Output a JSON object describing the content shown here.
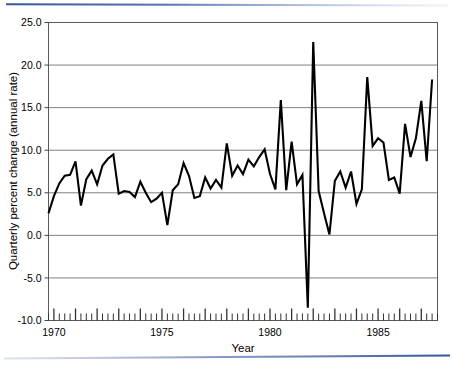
{
  "chart_data": {
    "type": "line",
    "title": "",
    "xlabel": "Year",
    "ylabel": "Quarterly percent change (annual rate)",
    "xlim": [
      1969.75,
      1987.75
    ],
    "ylim": [
      -10.0,
      25.0
    ],
    "grid": true,
    "legend": false,
    "legend_position": "none",
    "line_color": "#000000",
    "grid_color": "#808080",
    "frame_color": "#555555",
    "y_ticks": [
      "25.0",
      "20.0",
      "15.0",
      "10.0",
      "5.0",
      "0.0",
      "-5.0",
      "-10.0"
    ],
    "y_tick_values": [
      25.0,
      20.0,
      15.0,
      10.0,
      5.0,
      0.0,
      -5.0,
      -10.0
    ],
    "x_ticks": [
      "1970",
      "1975",
      "1980",
      "1985"
    ],
    "x_tick_values": [
      1970,
      1975,
      1980,
      1985
    ],
    "x_minor_tick_interval": 0.25,
    "series": [
      {
        "name": "Quarterly percent change (annual rate)",
        "x": [
          1969.75,
          1970.0,
          1970.25,
          1970.5,
          1970.75,
          1971.0,
          1971.25,
          1971.5,
          1971.75,
          1972.0,
          1972.25,
          1972.5,
          1972.75,
          1973.0,
          1973.25,
          1973.5,
          1973.75,
          1974.0,
          1974.25,
          1974.5,
          1974.75,
          1975.0,
          1975.25,
          1975.5,
          1975.75,
          1976.0,
          1976.25,
          1976.5,
          1976.75,
          1977.0,
          1977.25,
          1977.5,
          1977.75,
          1978.0,
          1978.25,
          1978.5,
          1978.75,
          1979.0,
          1979.25,
          1979.5,
          1979.75,
          1980.0,
          1980.25,
          1980.5,
          1980.75,
          1981.0,
          1981.25,
          1981.5,
          1981.75,
          1982.0,
          1982.25,
          1982.5,
          1982.75,
          1983.0,
          1983.25,
          1983.5,
          1983.75,
          1984.0,
          1984.25,
          1984.5,
          1984.75,
          1985.0,
          1985.25,
          1985.5,
          1985.75,
          1986.0,
          1986.25,
          1986.5,
          1986.75,
          1987.0,
          1987.25,
          1987.5
        ],
        "values": [
          2.6,
          4.6,
          6.1,
          7.0,
          7.1,
          8.7,
          3.5,
          6.6,
          7.6,
          6.0,
          8.2,
          9.0,
          9.5,
          4.9,
          5.2,
          5.1,
          4.5,
          6.3,
          5.0,
          3.9,
          4.3,
          5.0,
          1.2,
          5.3,
          6.0,
          8.5,
          7.0,
          4.4,
          4.6,
          6.8,
          5.5,
          6.5,
          5.6,
          10.8,
          7.0,
          8.2,
          7.2,
          8.9,
          8.1,
          9.2,
          10.1,
          7.2,
          5.4,
          15.9,
          5.3,
          11.0,
          6.0,
          7.1,
          -8.5,
          22.7,
          5.2,
          2.6,
          0.1,
          6.4,
          7.5,
          5.6,
          7.5,
          3.7,
          5.4,
          18.6,
          10.5,
          11.4,
          10.9,
          6.5,
          6.8,
          4.9,
          13.1,
          9.2,
          11.4,
          15.8,
          8.7,
          18.3
        ]
      }
    ]
  }
}
